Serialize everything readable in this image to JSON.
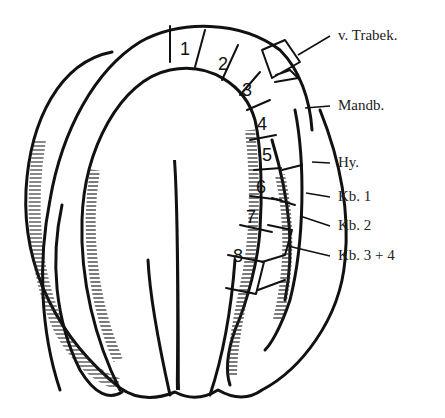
{
  "diagram": {
    "type": "embryo-segment-schematic",
    "segment_numbers": [
      "1",
      "2",
      "3",
      "4",
      "5",
      "6",
      "7",
      "8"
    ],
    "labels": [
      {
        "id": "v-trabek",
        "text": "v. Trabek."
      },
      {
        "id": "mandb",
        "text": "Mandb."
      },
      {
        "id": "hy",
        "text": "Hy."
      },
      {
        "id": "kb1",
        "text": "Kb. 1"
      },
      {
        "id": "kb2",
        "text": "Kb. 2"
      },
      {
        "id": "kb34",
        "text": "Kb. 3 + 4"
      }
    ],
    "colors": {
      "ink": "#111111",
      "background": "#ffffff"
    }
  }
}
